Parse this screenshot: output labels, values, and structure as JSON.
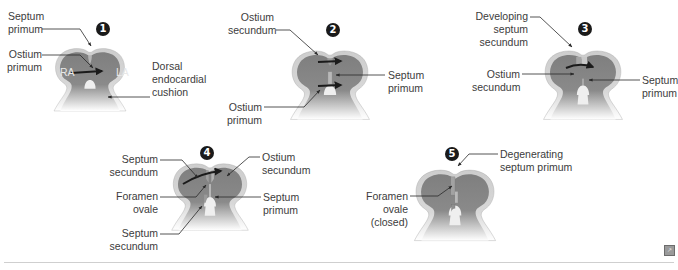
{
  "figure": {
    "colors": {
      "chamber": "#7f7f7f",
      "wall": "#c9c9c9",
      "wall_outline": "#9c9c9c",
      "cushion": "#ededed",
      "septum": "#a8a8a8",
      "arrow": "#1b1b1b",
      "leader": "#2a2a2a",
      "rule": "#cfcfcf"
    },
    "top_cut_text": "Developing septum secundum (cut)",
    "panels": [
      {
        "step": "1",
        "labels": {
          "septum_primum": [
            "Septum",
            "primum"
          ],
          "ostium_primum": [
            "Ostium",
            "primum"
          ],
          "ra": "RA",
          "la": "LA",
          "dorsal_endocardial_cushion": [
            "Dorsal",
            "endocardial",
            "cushion"
          ]
        }
      },
      {
        "step": "2",
        "labels": {
          "ostium_secundum": [
            "Ostium",
            "secundum"
          ],
          "septum_primum": [
            "Septum",
            "primum"
          ],
          "ostium_primum": [
            "Ostium",
            "primum"
          ]
        }
      },
      {
        "step": "3",
        "labels": {
          "developing_septum_secundum": [
            "Developing",
            "septum",
            "secundum"
          ],
          "ostium_secundum": [
            "Ostium",
            "secundum"
          ],
          "septum_primum": [
            "Septum",
            "primum"
          ]
        }
      },
      {
        "step": "4",
        "labels": {
          "septum_secundum_top": [
            "Septum",
            "secundum"
          ],
          "foramen_ovale": [
            "Foramen",
            "ovale"
          ],
          "septum_secundum_bottom": [
            "Septum",
            "secundum"
          ],
          "ostium_secundum": [
            "Ostium",
            "secundum"
          ],
          "septum_primum": [
            "Septum",
            "primum"
          ]
        }
      },
      {
        "step": "5",
        "labels": {
          "degenerating_septum_primum": [
            "Degenerating",
            "septum primum"
          ],
          "foramen_ovale_closed": [
            "Foramen",
            "ovale",
            "(closed)"
          ]
        }
      }
    ]
  }
}
